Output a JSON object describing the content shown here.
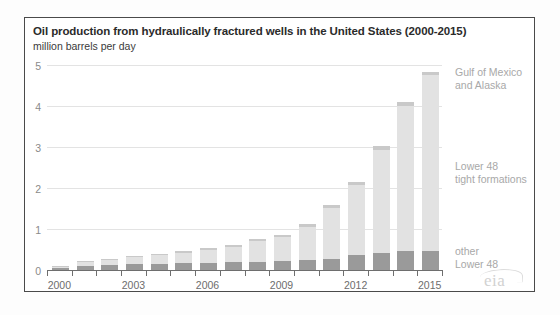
{
  "chart_data": {
    "type": "bar",
    "stacked": true,
    "title": "Oil production from hydraulically fractured wells in the United States (2000-2015)",
    "subtitle": "million barrels per day",
    "xlabel": "",
    "ylabel": "",
    "ylim": [
      0,
      5
    ],
    "yticks": [
      0,
      1,
      2,
      3,
      4,
      5
    ],
    "ytick_labels": [
      "0",
      "1",
      "2",
      "3",
      "4",
      "5"
    ],
    "grid": true,
    "legend_position": "right-inline",
    "x": [
      2000,
      2001,
      2002,
      2003,
      2004,
      2005,
      2006,
      2007,
      2008,
      2009,
      2010,
      2011,
      2012,
      2013,
      2014,
      2015
    ],
    "xtick_labels": [
      "2000",
      "2003",
      "2006",
      "2009",
      "2012",
      "2015"
    ],
    "xticks": [
      2000,
      2003,
      2006,
      2009,
      2012,
      2015
    ],
    "series": [
      {
        "name": "other Lower 48",
        "color": "#9a9a9a",
        "values": [
          0.08,
          0.12,
          0.14,
          0.16,
          0.18,
          0.19,
          0.2,
          0.21,
          0.22,
          0.24,
          0.26,
          0.3,
          0.38,
          0.45,
          0.5,
          0.48
        ]
      },
      {
        "name": "Lower 48 tight formations",
        "color": "#e2e2e2",
        "values": [
          0.03,
          0.1,
          0.13,
          0.17,
          0.21,
          0.26,
          0.32,
          0.38,
          0.5,
          0.58,
          0.82,
          1.24,
          1.72,
          2.5,
          3.53,
          4.3
        ]
      },
      {
        "name": "Gulf of Mexico and Alaska",
        "color": "#c9c9c9",
        "values": [
          0.01,
          0.02,
          0.02,
          0.02,
          0.03,
          0.03,
          0.04,
          0.04,
          0.05,
          0.06,
          0.07,
          0.08,
          0.08,
          0.1,
          0.1,
          0.08
        ]
      }
    ],
    "totals": [
      0.12,
      0.24,
      0.29,
      0.35,
      0.42,
      0.48,
      0.56,
      0.63,
      0.77,
      0.88,
      1.15,
      1.62,
      2.18,
      3.05,
      4.13,
      4.86
    ]
  },
  "annotations": {
    "gulf_line1": "Gulf of Mexico",
    "gulf_line2": "and Alaska",
    "tight_line1": "Lower 48",
    "tight_line2": "tight formations",
    "other_line1": "other",
    "other_line2": "Lower 48"
  },
  "branding": {
    "logo_text": "eia"
  }
}
